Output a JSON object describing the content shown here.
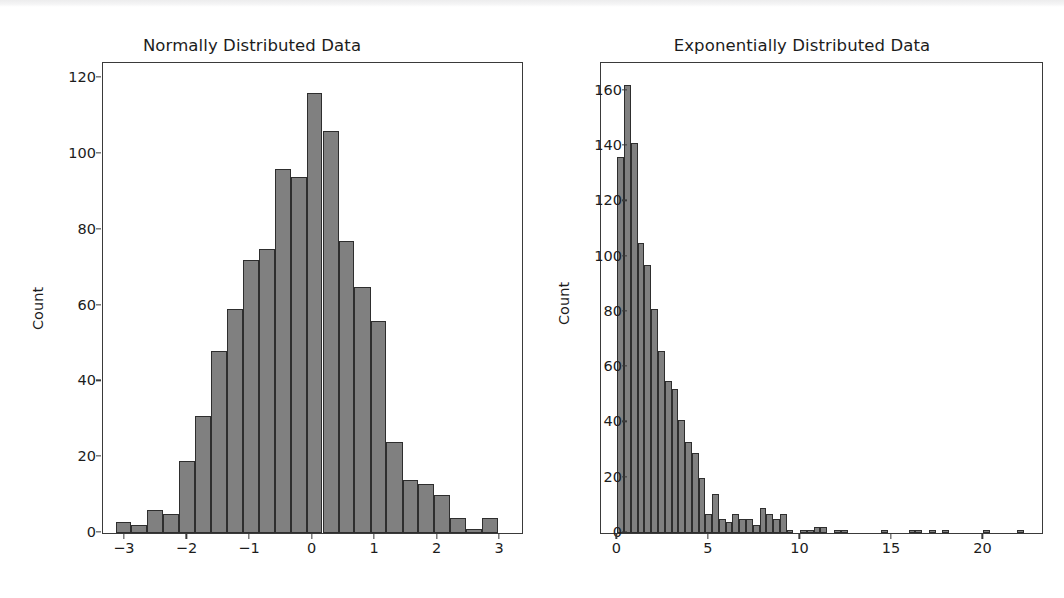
{
  "figure": {
    "background_color": "#ffffff",
    "bar_face_color": "#808080",
    "bar_edge_color": "#2e2e2e",
    "axis_color": "#3a3a3a",
    "text_color": "#1c1c1c"
  },
  "chart_data": [
    {
      "type": "bar",
      "id": "normal-histogram",
      "title": "Normally Distributed Data",
      "xlabel": "",
      "ylabel": "Count",
      "xlim": [
        -3.35,
        3.35
      ],
      "ylim": [
        0,
        124
      ],
      "xticks": [
        -3,
        -2,
        -1,
        0,
        1,
        2,
        3
      ],
      "xticklabels": [
        "−3",
        "−2",
        "−1",
        "0",
        "1",
        "2",
        "3"
      ],
      "yticks": [
        0,
        20,
        40,
        60,
        80,
        100,
        120
      ],
      "yticklabels": [
        "0",
        "20",
        "40",
        "60",
        "80",
        "100",
        "120"
      ],
      "grid": false,
      "legend": false,
      "bin_edges": [
        -3.15,
        -2.9,
        -2.64,
        -2.39,
        -2.13,
        -1.88,
        -1.62,
        -1.37,
        -1.11,
        -0.86,
        -0.6,
        -0.35,
        -0.09,
        0.16,
        0.42,
        0.67,
        0.93,
        1.18,
        1.44,
        1.69,
        1.95,
        2.2,
        2.46,
        2.71,
        2.97,
        3.12
      ],
      "bin_centers": [
        -3.02,
        -2.77,
        -2.52,
        -2.26,
        -2.01,
        -1.75,
        -1.5,
        -1.24,
        -0.99,
        -0.73,
        -0.48,
        -0.22,
        0.03,
        0.29,
        0.54,
        0.8,
        1.05,
        1.31,
        1.56,
        1.82,
        2.07,
        2.33,
        2.58,
        2.84,
        3.05
      ],
      "values": [
        3,
        2,
        6,
        5,
        19,
        31,
        48,
        59,
        72,
        75,
        96,
        94,
        116,
        106,
        77,
        65,
        56,
        24,
        14,
        13,
        10,
        4,
        1,
        4,
        0
      ]
    },
    {
      "type": "bar",
      "id": "exponential-histogram",
      "title": "Exponentially Distributed Data",
      "xlabel": "",
      "ylabel": "Count",
      "xlim": [
        -0.9,
        23.2
      ],
      "ylim": [
        0,
        170
      ],
      "xticks": [
        0,
        5,
        10,
        15,
        20
      ],
      "xticklabels": [
        "0",
        "5",
        "10",
        "15",
        "20"
      ],
      "yticks": [
        0,
        20,
        40,
        60,
        80,
        100,
        120,
        140,
        160
      ],
      "yticklabels": [
        "0",
        "20",
        "40",
        "60",
        "80",
        "100",
        "120",
        "140",
        "160"
      ],
      "grid": false,
      "legend": false,
      "bin_width": 0.37,
      "bin_centers": [
        0.18,
        0.55,
        0.92,
        1.29,
        1.66,
        2.03,
        2.4,
        2.77,
        3.14,
        3.51,
        3.88,
        4.25,
        4.62,
        4.99,
        5.36,
        5.73,
        6.1,
        6.47,
        6.84,
        7.21,
        7.58,
        7.95,
        8.32,
        8.69,
        9.06,
        9.43,
        9.8,
        10.17,
        10.54,
        10.91,
        11.28,
        11.65,
        12.02,
        12.39,
        12.76,
        13.13,
        13.5,
        13.87,
        14.24,
        14.61,
        14.98,
        15.35,
        15.72,
        16.09,
        16.46,
        16.83,
        17.2,
        17.57,
        17.94,
        18.31,
        18.68,
        19.05,
        19.42,
        19.79,
        20.16,
        20.53,
        20.9,
        21.27,
        21.64,
        22.01
      ],
      "values": [
        136,
        162,
        141,
        105,
        97,
        81,
        66,
        55,
        52,
        41,
        33,
        29,
        20,
        7,
        14,
        5,
        4,
        7,
        5,
        5,
        3,
        9,
        7,
        5,
        7,
        1,
        0,
        1,
        1,
        2,
        2,
        0,
        1,
        1,
        0,
        0,
        0,
        0,
        0,
        1,
        0,
        0,
        0,
        1,
        1,
        0,
        1,
        0,
        1,
        0,
        0,
        0,
        0,
        0,
        1,
        0,
        0,
        0,
        0,
        1
      ]
    }
  ]
}
